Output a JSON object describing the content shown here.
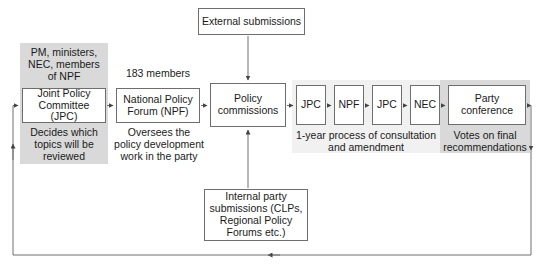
{
  "diagram": {
    "colors": {
      "band_dark": "#d9d9d9",
      "band_light": "#f1f1f1",
      "node_border": "#6e6e6e",
      "node_fill": "#ffffff",
      "connector": "#555555",
      "text": "#1a1a1a"
    },
    "nodes": {
      "external_submissions": "External submissions",
      "joint_policy_committee": "Joint Policy\nCommittee (JPC)",
      "national_policy_forum": "National Policy\nForum (NPF)",
      "policy_commissions": "Policy\ncommissions",
      "stage_jpc_1": "JPC",
      "stage_npf": "NPF",
      "stage_jpc_2": "JPC",
      "stage_nec": "NEC",
      "party_conference": "Party conference",
      "internal_submissions": "Internal party\nsubmissions (CLPs,\nRegional Policy\nForums etc.)"
    },
    "captions": {
      "jpc_membership": "PM, ministers,\nNEC, members\nof NPF",
      "npf_membership": "183 members",
      "jpc_role": "Decides which\ntopics will be\nreviewed",
      "npf_role": "Oversees the\npolicy development\nwork in the party",
      "consultation_stage": "1-year process of consultation\nand amendment",
      "conference_role": "Votes on final\nrecommendations"
    }
  }
}
